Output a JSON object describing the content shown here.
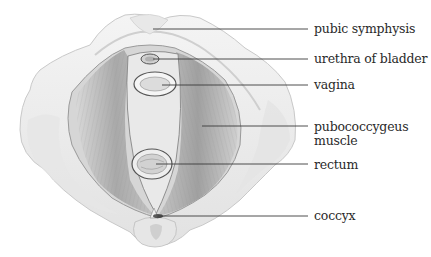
{
  "diagram": {
    "type": "anatomical-illustration",
    "colors": {
      "background": "#ffffff",
      "leader_line": "#3a3a3a",
      "label_text": "#2a2a2a",
      "bone": "#f1f1f1",
      "muscle": "#bdbdbd",
      "muscle_dark": "#8a8a8a"
    },
    "labels": [
      {
        "id": "pubic-symphysis",
        "text": "pubic symphysis"
      },
      {
        "id": "urethra",
        "text": "urethra of bladder"
      },
      {
        "id": "vagina",
        "text": "vagina"
      },
      {
        "id": "pubococcygeus-1",
        "text": "pubococcygeus"
      },
      {
        "id": "pubococcygeus-2",
        "text": "muscle"
      },
      {
        "id": "rectum",
        "text": "rectum"
      },
      {
        "id": "coccyx",
        "text": "coccyx"
      }
    ]
  }
}
